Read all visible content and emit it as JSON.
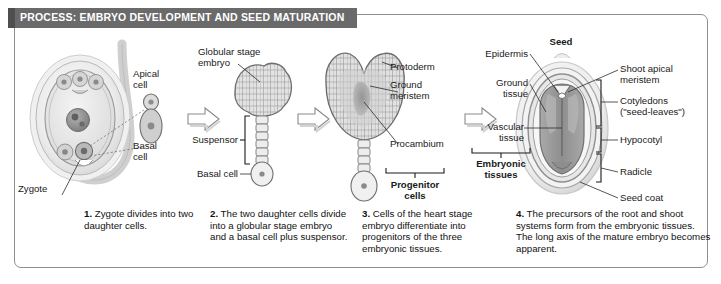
{
  "banner": {
    "title": "PROCESS: EMBRYO DEVELOPMENT AND SEED MATURATION"
  },
  "stage1": {
    "zygote": "Zygote",
    "apical_cell": "Apical\ncell",
    "basal_cell": "Basal\ncell"
  },
  "stage2": {
    "globular": "Globular stage\nembryo",
    "suspensor": "Suspensor",
    "basal_cell": "Basal cell"
  },
  "stage3": {
    "protoderm": "Protoderm",
    "ground_meristem": "Ground\nmeristem",
    "procambium": "Procambium",
    "progenitor": "Progenitor\ncells"
  },
  "stage4": {
    "seed": "Seed",
    "epidermis": "Epidermis",
    "ground_tissue": "Ground\ntissue",
    "vascular_tissue": "Vascular\ntissue",
    "embryonic_tissues": "Embryonic\ntissues",
    "shoot_apical_meristem": "Shoot apical\nmeristem",
    "cotyledons": "Cotyledons\n(\"seed-leaves\")",
    "hypocotyl": "Hypocotyl",
    "radicle": "Radicle",
    "seed_coat": "Seed coat"
  },
  "captions": [
    {
      "num": "1.",
      "text": " Zygote divides into two daughter cells."
    },
    {
      "num": "2.",
      "text": " The two daughter cells divide into a globular stage embryo and a basal cell plus suspensor."
    },
    {
      "num": "3.",
      "text": " Cells of the heart stage embryo differentiate into progenitors of the three embryonic tissues."
    },
    {
      "num": "4.",
      "text": " The precursors of the root and shoot systems form from the embryonic tissues. The long axis of the mature embryo becomes apparent."
    }
  ],
  "colors": {
    "banner_bg": "#6a6a6a",
    "frame": "#8e8e8e",
    "ink": "#1a1a1a"
  }
}
